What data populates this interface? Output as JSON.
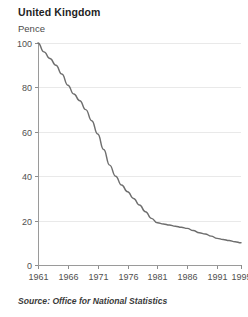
{
  "chart": {
    "title": "United Kingdom",
    "unit_label": "Pence",
    "source": "Source: Office for National Statistics"
  },
  "chart_data": {
    "type": "line",
    "title": "United Kingdom",
    "subtitle": "",
    "xlabel": "",
    "ylabel": "Pence",
    "xlim": [
      1961,
      1995
    ],
    "ylim": [
      0,
      100
    ],
    "grid": true,
    "legend": null,
    "xticks": [
      1961,
      1966,
      1971,
      1976,
      1981,
      1986,
      1991,
      1995
    ],
    "yticks": [
      0,
      20,
      40,
      60,
      80,
      100
    ],
    "annotations": [
      "Source: Office for National Statistics"
    ],
    "series": [
      {
        "name": "Pence",
        "color": "#6e6e6e",
        "x": [
          1961,
          1962,
          1963,
          1964,
          1965,
          1966,
          1967,
          1968,
          1969,
          1970,
          1971,
          1972,
          1973,
          1974,
          1975,
          1976,
          1977,
          1978,
          1979,
          1980,
          1981,
          1982,
          1983,
          1984,
          1985,
          1986,
          1987,
          1988,
          1989,
          1990,
          1991,
          1992,
          1993,
          1994,
          1995
        ],
        "values": [
          100,
          96,
          93,
          90,
          86,
          81,
          77,
          74,
          70,
          65,
          59,
          52,
          45,
          40,
          36,
          33,
          30,
          27,
          24,
          21,
          19,
          18.5,
          18,
          17.5,
          17,
          16.5,
          15.5,
          14.5,
          14,
          13,
          12,
          11.5,
          11,
          10.5,
          10
        ]
      }
    ]
  },
  "geometry": {
    "plot_left": 38,
    "plot_right": 241,
    "plot_top": 43,
    "plot_bottom": 265
  }
}
